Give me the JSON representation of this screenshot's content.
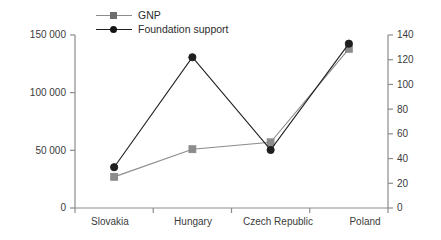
{
  "chart_data": {
    "type": "line",
    "title": "",
    "subtitle": "",
    "xlabel": "",
    "ylabel": "",
    "categories": [
      "Slovakia",
      "Hungary",
      "Czech Republic",
      "Poland"
    ],
    "series": [
      {
        "name": "GNP",
        "axis": "left",
        "color": "#8c8c8c",
        "marker": "square",
        "values": [
          27000,
          51000,
          57000,
          138000
        ]
      },
      {
        "name": "Foundation support",
        "axis": "right",
        "color": "#1f1f1f",
        "marker": "circle",
        "values": [
          33,
          122,
          47,
          133
        ]
      }
    ],
    "left_axis": {
      "ticks": [
        "0",
        "50 000",
        "100 000",
        "150 000"
      ],
      "tick_values": [
        0,
        50000,
        100000,
        150000
      ],
      "ylim": [
        0,
        150000
      ]
    },
    "right_axis": {
      "ticks": [
        "0",
        "20",
        "40",
        "60",
        "80",
        "100",
        "120",
        "140"
      ],
      "tick_values": [
        0,
        20,
        40,
        60,
        80,
        100,
        120,
        140
      ],
      "ylim": [
        0,
        140
      ]
    },
    "legend": {
      "position": "top-left",
      "entries": [
        {
          "label": "GNP",
          "color": "#8c8c8c",
          "marker": "square"
        },
        {
          "label": "Foundation support",
          "color": "#1f1f1f",
          "marker": "circle"
        }
      ]
    },
    "grid": false
  }
}
